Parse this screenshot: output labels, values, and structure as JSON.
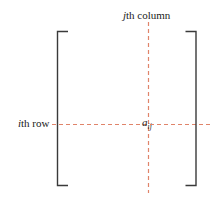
{
  "figure": {
    "type": "diagram",
    "canvas": {
      "width": 216,
      "height": 203,
      "background": "#ffffff"
    },
    "labels": {
      "column": {
        "italic_part": "j",
        "rest": "th column"
      },
      "row": {
        "italic_part": "i",
        "rest": "th row"
      },
      "element": {
        "base": "a",
        "subscript": "ij"
      }
    },
    "colors": {
      "bracket": "#3a3a3a",
      "guide_line": "#e0846a",
      "text": "#1a1a1a"
    },
    "bracket": {
      "left_x": 57,
      "right_x": 196,
      "top_y": 31,
      "bottom_y": 186,
      "serif_length": 11,
      "stroke_width": 1.4
    },
    "guides": {
      "vertical": {
        "x": 148.5,
        "y_start": 22,
        "y_end": 193,
        "dash": "4 3"
      },
      "horizontal": {
        "y": 124.5,
        "x_start": 52,
        "x_end": 211,
        "dash": "4 3"
      }
    }
  }
}
